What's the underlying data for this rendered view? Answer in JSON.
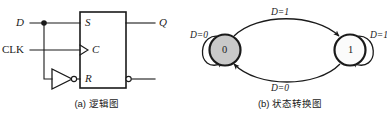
{
  "figure": {
    "panels": [
      {
        "id": "logic-diagram",
        "caption": "(a) 逻辑图",
        "inputs": [
          {
            "name": "D",
            "label": "D",
            "style": "italic"
          },
          {
            "name": "CLK",
            "label": "CLK",
            "style": "upright"
          }
        ],
        "block": {
          "pins_left": [
            {
              "name": "S",
              "label": "S",
              "inverted": false,
              "clock": false
            },
            {
              "name": "C",
              "label": "C",
              "inverted": false,
              "clock": true
            },
            {
              "name": "R",
              "label": "R",
              "inverted": true,
              "clock": false
            }
          ],
          "pins_right": [
            {
              "name": "Q",
              "label": "Q",
              "inverted": false
            },
            {
              "name": "Qbar",
              "label": "Q",
              "inverted": true,
              "overline": true
            }
          ]
        },
        "gates": [
          {
            "name": "inverter",
            "label": "NOT",
            "inverted_output": true
          }
        ]
      },
      {
        "id": "state-transition-diagram",
        "caption": "(b) 状态转换图",
        "states": [
          {
            "name": "state-0",
            "label": "0",
            "fill": "#c9c9c9"
          },
          {
            "name": "state-1",
            "label": "1",
            "fill": "#fbfbfb"
          }
        ],
        "transitions": [
          {
            "name": "self-loop-0",
            "from": "0",
            "to": "0",
            "label": "D=0",
            "var": "D",
            "value": "0"
          },
          {
            "name": "arc-0-to-1",
            "from": "0",
            "to": "1",
            "label": "D=1",
            "var": "D",
            "value": "1"
          },
          {
            "name": "arc-1-to-0",
            "from": "1",
            "to": "0",
            "label": "D=0",
            "var": "D",
            "value": "0"
          },
          {
            "name": "self-loop-1",
            "from": "1",
            "to": "1",
            "label": "D=1",
            "var": "D",
            "value": "1"
          }
        ]
      }
    ],
    "colors": {
      "ink": "#1a1a1a",
      "state_active_fill": "#c9c9c9",
      "state_inactive_fill": "#fbfbfb",
      "background": "#ffffff"
    }
  }
}
